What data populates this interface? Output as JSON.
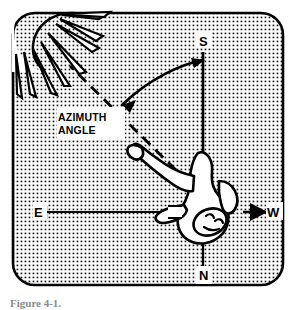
{
  "figure": {
    "title_caption": "Figure 4-1.",
    "panel": {
      "fill_color": "#ffffff",
      "stipple_color": "#1a1a1a",
      "border_color": "#000000",
      "corner_radius": 22
    },
    "compass_labels": {
      "south": "S",
      "north": "N",
      "east": "E",
      "west": "W"
    },
    "annotation": {
      "line1": "AZIMUTH",
      "line2": "ANGLE"
    },
    "elements": [
      {
        "name": "sun",
        "description": "sun-with-rays"
      },
      {
        "name": "person",
        "description": "person-figure-overhead"
      },
      {
        "name": "sight-line",
        "description": "dashed-line-to-sun"
      },
      {
        "name": "azimuth-arc",
        "description": "double-headed-curved-arrow"
      },
      {
        "name": "ns-axis",
        "description": "vertical-axis"
      },
      {
        "name": "ew-axis",
        "description": "horizontal-axis"
      }
    ]
  }
}
